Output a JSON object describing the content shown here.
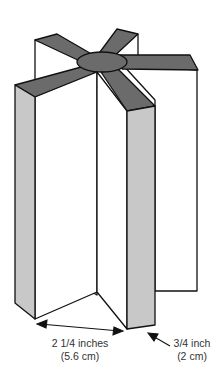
{
  "diagram": {
    "colors": {
      "top_arms": "#6b6b6b",
      "side_panels": "#c8c8c8",
      "faces": "#ffffff",
      "outline": "#111111"
    },
    "labels": {
      "width_line1": "2 1/4 inches",
      "width_line2": "(5.6 cm)",
      "depth_line1": "3/4 inch",
      "depth_line2": "(2 cm)"
    }
  }
}
